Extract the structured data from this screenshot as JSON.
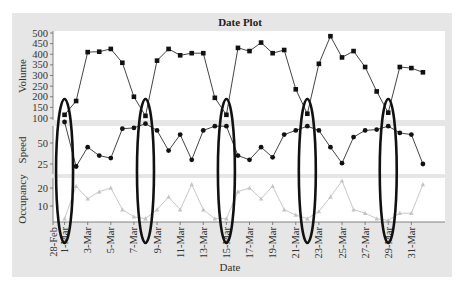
{
  "chart_data": {
    "type": "line",
    "title": "Date Plot",
    "xlabel": "Date",
    "x_tick_labels": [
      "28-Feb",
      "1-Mar",
      "3-Mar",
      "5-Mar",
      "7-Mar",
      "9-Mar",
      "11-Mar",
      "13-Mar",
      "15-Mar",
      "17-Mar",
      "19-Mar",
      "21-Mar",
      "23-Mar",
      "25-Mar",
      "27-Mar",
      "29-Mar",
      "31-Mar"
    ],
    "x": [
      "29-Feb",
      "1-Mar",
      "2-Mar",
      "3-Mar",
      "4-Mar",
      "5-Mar",
      "6-Mar",
      "7-Mar",
      "8-Mar",
      "9-Mar",
      "10-Mar",
      "11-Mar",
      "12-Mar",
      "13-Mar",
      "14-Mar",
      "15-Mar",
      "16-Mar",
      "17-Mar",
      "18-Mar",
      "19-Mar",
      "20-Mar",
      "21-Mar",
      "22-Mar",
      "23-Mar",
      "24-Mar",
      "25-Mar",
      "26-Mar",
      "27-Mar",
      "28-Mar",
      "29-Mar",
      "30-Mar",
      "31-Mar"
    ],
    "panels": [
      {
        "name": "Volume",
        "ylabel": "Volume",
        "ylim": [
          100,
          500
        ],
        "yticks": [
          100,
          150,
          200,
          250,
          300,
          350,
          400,
          450,
          500
        ],
        "marker": "square",
        "color": "#222222",
        "values": [
          115,
          180,
          410,
          412,
          425,
          360,
          200,
          110,
          370,
          425,
          395,
          405,
          405,
          195,
          115,
          430,
          415,
          455,
          405,
          420,
          235,
          120,
          355,
          485,
          385,
          415,
          340,
          225,
          125,
          340,
          335,
          315
        ]
      },
      {
        "name": "Speed",
        "ylabel": "Speed",
        "ylim": [
          15,
          85
        ],
        "yticks": [
          25,
          50
        ],
        "marker": "circle",
        "color": "#222222",
        "values": [
          75,
          22,
          45,
          35,
          32,
          67,
          68,
          73,
          65,
          41,
          60,
          30,
          65,
          70,
          70,
          35,
          30,
          45,
          33,
          60,
          65,
          70,
          65,
          45,
          26,
          57,
          65,
          66,
          70,
          62,
          60,
          25
        ]
      },
      {
        "name": "Occupancy",
        "ylabel": "Occupancy",
        "ylim": [
          0,
          27
        ],
        "yticks": [
          10,
          20
        ],
        "marker": "triangle",
        "color": "#bbbbbb",
        "values": [
          3,
          21,
          14,
          18,
          20,
          8,
          4,
          3,
          8,
          15,
          8,
          22,
          8,
          3,
          3,
          18,
          20,
          14,
          21,
          8,
          5,
          3,
          7,
          15,
          24,
          8,
          6,
          3,
          2,
          6,
          6,
          22
        ]
      }
    ],
    "annotations": {
      "type": "ellipse",
      "description": "Highlighted weekly low-volume days",
      "dates": [
        "29-Feb",
        "7-Mar",
        "14-Mar",
        "21-Mar",
        "28-Mar"
      ]
    },
    "grid": false,
    "legend": "none"
  }
}
